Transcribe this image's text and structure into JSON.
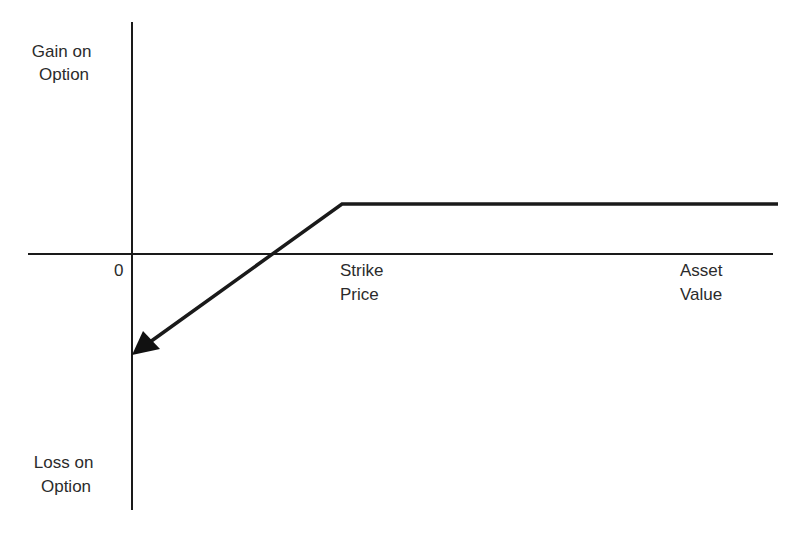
{
  "diagram": {
    "type": "payoff-diagram",
    "y_axis": {
      "top_label": [
        "Gain on",
        "Option"
      ],
      "bottom_label": [
        "Loss on",
        "Option"
      ]
    },
    "x_axis": {
      "origin_label": "0",
      "strike_label": [
        "Strike",
        "Price"
      ],
      "end_label": [
        "Asset",
        "Value"
      ]
    },
    "payoff_curve": {
      "description": "Flat gain above strike price; slopes down-left into loss below strike, arrow pointing toward loss at zero asset value",
      "points": [
        [
          778,
          204
        ],
        [
          342,
          204
        ],
        [
          133,
          354
        ]
      ]
    },
    "colors": {
      "line": "#1a1a1a",
      "text": "#2b2b2b",
      "background": "#ffffff"
    }
  }
}
